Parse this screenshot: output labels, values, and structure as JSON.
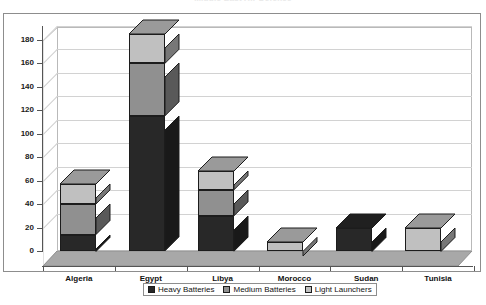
{
  "chart_data": {
    "type": "bar",
    "subtype": "stacked-column-3d",
    "title": "Middle East Air Defence",
    "xlabel": "",
    "ylabel": "",
    "categories": [
      "Algeria",
      "Egypt",
      "Libya",
      "Morocco",
      "Sudan",
      "Tunisia"
    ],
    "series": [
      {
        "name": "Heavy Batteries",
        "color": "#282828",
        "values": [
          14,
          115,
          30,
          0,
          20,
          0
        ]
      },
      {
        "name": "Medium Batteries",
        "color": "#909090",
        "values": [
          26,
          45,
          22,
          0,
          0,
          0
        ]
      },
      {
        "name": "Light Launchers",
        "color": "#c0c0c0",
        "values": [
          17,
          25,
          16,
          8,
          0,
          20
        ]
      }
    ],
    "totals": [
      57,
      185,
      68,
      8,
      20,
      20
    ],
    "ylim": [
      0,
      190
    ],
    "yticks": [
      0,
      20,
      40,
      60,
      80,
      100,
      120,
      140,
      160,
      180
    ],
    "ytick_labels": [
      "0",
      "20",
      "40",
      "60",
      "80",
      "100",
      "120",
      "140",
      "160",
      "180"
    ],
    "grid": true,
    "legend_position": "bottom"
  },
  "legend": {
    "items": [
      {
        "label": "Heavy Batteries",
        "color": "#282828"
      },
      {
        "label": "Medium Batteries",
        "color": "#909090"
      },
      {
        "label": "Light Launchers",
        "color": "#c0c0c0"
      }
    ]
  },
  "colors": {
    "plot_background": "#ffffff",
    "floor": "#a8a8a8",
    "gridline": "#d2d2d2",
    "axis": "#555555",
    "frame": "#8d8d8d",
    "text": "#111111"
  }
}
